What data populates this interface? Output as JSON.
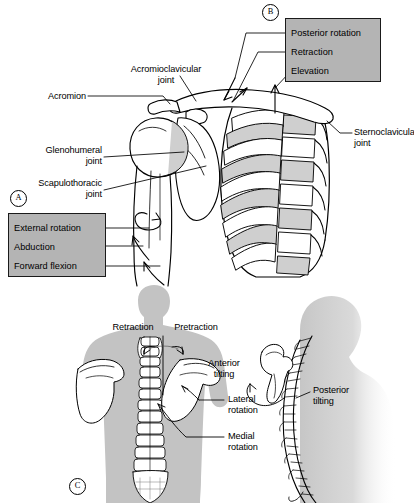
{
  "figure": {
    "width": 414,
    "height": 503,
    "background": "#ffffff",
    "panel_box_fill": "#b4b4b4",
    "panel_box_stroke": "#1a1a1a",
    "silhouette_fill": "#c3c3c3",
    "bone_shade": "#cfcfcf",
    "line_color": "#000000"
  },
  "panels": {
    "a": {
      "marker": "A",
      "box_labels": [
        {
          "text": "External rotation"
        },
        {
          "text": "Abduction"
        },
        {
          "text": "Forward flexion"
        }
      ]
    },
    "b": {
      "marker": "B",
      "box_labels": [
        {
          "text": "Posterior rotation"
        },
        {
          "text": "Retraction"
        },
        {
          "text": "Elevation"
        }
      ]
    },
    "c": {
      "marker": "C",
      "labels": [
        {
          "text": "Retraction"
        },
        {
          "text": "Pretraction"
        },
        {
          "text": "Anterior\ntilting"
        },
        {
          "text": "Posterior\ntilting"
        },
        {
          "text": "Lateral\nrotation"
        },
        {
          "text": "Medial\nrotation"
        }
      ]
    }
  },
  "anatomy_labels": [
    {
      "id": "acromioclavicular-joint",
      "text": "Acromioclavicular\njoint"
    },
    {
      "id": "acromion",
      "text": "Acromion"
    },
    {
      "id": "glenohumeral-joint",
      "text": "Glenohumeral\njoint"
    },
    {
      "id": "scapulothoracic-joint",
      "text": "Scapulothoracic\njoint"
    },
    {
      "id": "sternoclavicular-joint",
      "text": "Sternoclavicular\njoint"
    }
  ]
}
